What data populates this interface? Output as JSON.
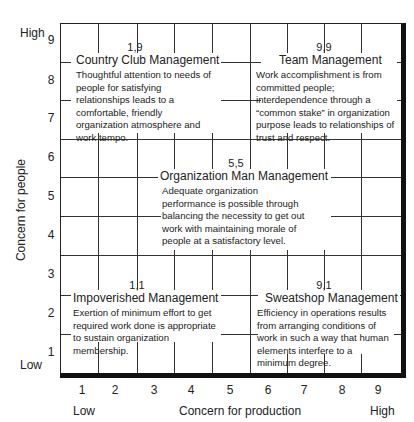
{
  "diagram": {
    "type": "managerial-grid",
    "y_axis": {
      "title": "Concern for people",
      "ticks": [
        "9",
        "8",
        "7",
        "6",
        "5",
        "4",
        "3",
        "2",
        "1"
      ],
      "high_label": "High",
      "low_label": "Low"
    },
    "x_axis": {
      "title": "Concern for production",
      "ticks": [
        "1",
        "2",
        "3",
        "4",
        "5",
        "6",
        "7",
        "8",
        "9"
      ],
      "low_label": "Low",
      "high_label": "High"
    },
    "styles": [
      {
        "coord": "1,9",
        "name": "Country Club Management",
        "description": "Thoughtful attention to needs of people for satisfying relationships leads to a comfortable, friendly organization atmosphere and work tempo."
      },
      {
        "coord": "9,9",
        "name": "Team Management",
        "description": "Work accomplishment is from committed people; interdependence through a “common stake” in organization purpose leads to relationships of trust and respect."
      },
      {
        "coord": "5,5",
        "name": "Organization Man Management",
        "description": "Adequate organization performance is possible through balancing the necessity to get out work with maintaining morale of people at a satisfactory level."
      },
      {
        "coord": "1,1",
        "name": "Impoverished Management",
        "description": "Exertion of minimum effort to get required work done is appropriate to sustain organization membership."
      },
      {
        "coord": "9,1",
        "name": "Sweatshop Management",
        "description": "Efficiency in operations results from arranging conditions of work in such a way that human elements interfere to a minimum degree."
      }
    ]
  }
}
